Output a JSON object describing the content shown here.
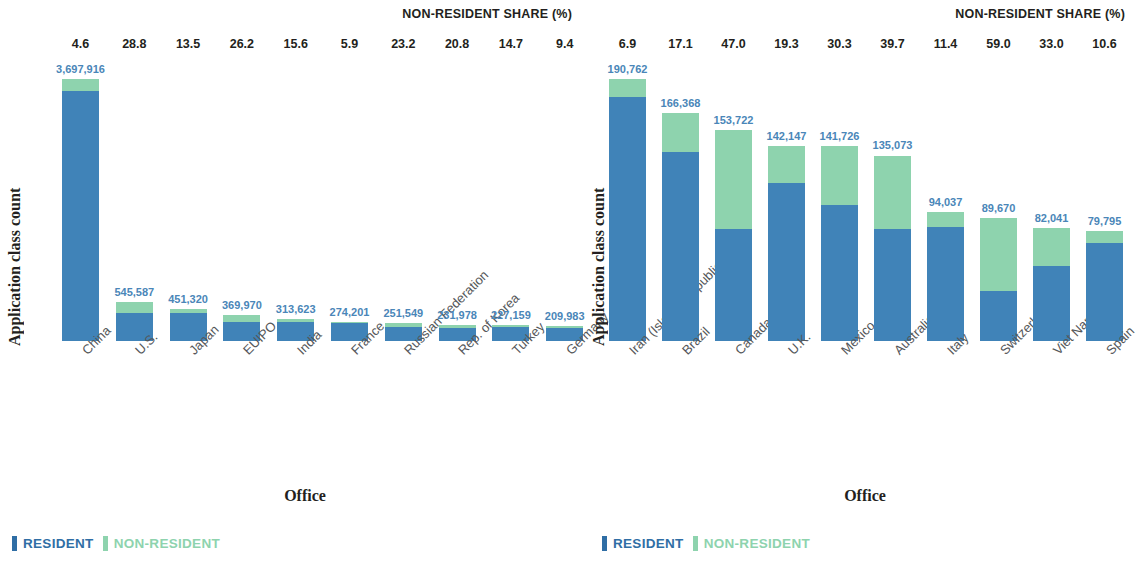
{
  "chart_data": [
    {
      "type": "bar",
      "subtype": "stacked",
      "panel": "left",
      "title": "NON-RESIDENT SHARE (%)",
      "xlabel": "Office",
      "ylabel": "Application class count",
      "legend": [
        "RESIDENT",
        "NON-RESIDENT"
      ],
      "legend_position": "bottom-left",
      "grid": false,
      "colors": {
        "resident": "#4083b8",
        "non_resident": "#8ed3ae",
        "value_label": "#4a86b8"
      },
      "categories": [
        "China",
        "U.S.",
        "Japan",
        "EUIPO",
        "India",
        "France",
        "Russian Federation",
        "Rep. of Korea",
        "Turkey",
        "Germany"
      ],
      "totals": [
        3697916,
        545587,
        451320,
        369970,
        313623,
        274201,
        251549,
        231978,
        227159,
        209983
      ],
      "total_labels": [
        "3,697,916",
        "545,587",
        "451,320",
        "369,970",
        "313,623",
        "274,201",
        "251,549",
        "231,978",
        "227,159",
        "209,983"
      ],
      "nonresident_share_pct": [
        4.6,
        28.8,
        13.5,
        26.2,
        15.6,
        5.9,
        23.2,
        20.8,
        14.7,
        9.4
      ],
      "nonresident_share_labels": [
        "4.6",
        "28.8",
        "13.5",
        "26.2",
        "15.6",
        "5.9",
        "23.2",
        "20.8",
        "14.7",
        "9.4"
      ],
      "ylim": [
        0,
        3697916
      ]
    },
    {
      "type": "bar",
      "subtype": "stacked",
      "panel": "right",
      "title": "NON-RESIDENT SHARE (%)",
      "xlabel": "Office",
      "ylabel": "Application class count",
      "legend": [
        "RESIDENT",
        "NON-RESIDENT"
      ],
      "legend_position": "bottom-left",
      "grid": false,
      "colors": {
        "resident": "#4083b8",
        "non_resident": "#8ed3ae",
        "value_label": "#4a86b8"
      },
      "categories": [
        "Iran (Islamic Republic of)",
        "Brazil",
        "Canada",
        "U.K.",
        "Mexico",
        "Australia",
        "Italy",
        "Switzerland",
        "Viet Nam",
        "Spain"
      ],
      "totals": [
        190762,
        166368,
        153722,
        142147,
        141726,
        135073,
        94037,
        89670,
        82041,
        79795
      ],
      "total_labels": [
        "190,762",
        "166,368",
        "153,722",
        "142,147",
        "141,726",
        "135,073",
        "94,037",
        "89,670",
        "82,041",
        "79,795"
      ],
      "nonresident_share_pct": [
        6.9,
        17.1,
        47.0,
        19.3,
        30.3,
        39.7,
        11.4,
        59.0,
        33.0,
        10.6
      ],
      "nonresident_share_labels": [
        "6.9",
        "17.1",
        "47.0",
        "19.3",
        "30.3",
        "39.7",
        "11.4",
        "59.0",
        "33.0",
        "10.6"
      ],
      "ylim": [
        0,
        190762
      ]
    }
  ],
  "panels": {
    "left": {
      "nrs_title": "NON-RESIDENT SHARE (%)",
      "ylabel": "Application class count",
      "xlabel": "Office",
      "legend": {
        "resident": "RESIDENT",
        "non_resident": "NON-RESIDENT"
      }
    },
    "right": {
      "nrs_title": "NON-RESIDENT SHARE (%)",
      "ylabel": "Application class count",
      "xlabel": "Office",
      "legend": {
        "resident": "RESIDENT",
        "non_resident": "NON-RESIDENT"
      }
    }
  }
}
